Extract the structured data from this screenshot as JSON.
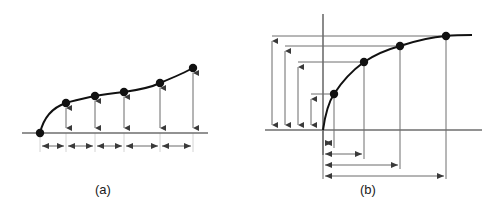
{
  "figure": {
    "background": "#ffffff",
    "stroke_curve": "#111111",
    "stroke_axis": "#6e6e6e",
    "stroke_dimension": "#5a5a5a",
    "dot_color": "#111111"
  },
  "panels": [
    {
      "id": "a",
      "caption": "(a)",
      "axis": {
        "x1": 22,
        "y1": 133,
        "x2": 208,
        "y2": 133
      },
      "curve_points": [
        {
          "x": 40,
          "y": 133
        },
        {
          "x": 66,
          "y": 103
        },
        {
          "x": 95,
          "y": 96
        },
        {
          "x": 124,
          "y": 92
        },
        {
          "x": 160,
          "y": 83
        },
        {
          "x": 193,
          "y": 68
        }
      ],
      "vertical_arrows": [
        {
          "x": 66,
          "top": 103,
          "bottom": 133
        },
        {
          "x": 95,
          "top": 96,
          "bottom": 133
        },
        {
          "x": 124,
          "top": 92,
          "bottom": 133
        },
        {
          "x": 160,
          "top": 83,
          "bottom": 133
        },
        {
          "x": 193,
          "top": 68,
          "bottom": 133
        }
      ],
      "interval_dimensions": [
        {
          "x1": 40,
          "x2": 66,
          "y": 146
        },
        {
          "x1": 66,
          "x2": 95,
          "y": 146
        },
        {
          "x1": 95,
          "x2": 124,
          "y": 146
        },
        {
          "x1": 124,
          "x2": 160,
          "y": 146
        },
        {
          "x1": 160,
          "x2": 193,
          "y": 146
        }
      ],
      "tick_guides": [
        {
          "x": 40,
          "y1": 133,
          "y2": 152
        },
        {
          "x": 66,
          "y1": 133,
          "y2": 152
        },
        {
          "x": 95,
          "y1": 133,
          "y2": 152
        },
        {
          "x": 124,
          "y1": 133,
          "y2": 152
        },
        {
          "x": 160,
          "y1": 133,
          "y2": 152
        },
        {
          "x": 193,
          "y1": 133,
          "y2": 152
        }
      ]
    },
    {
      "id": "b",
      "caption": "(b)",
      "x_axis": {
        "x1": 265,
        "y1": 130,
        "x2": 482,
        "y2": 130
      },
      "y_axis": {
        "x": 323,
        "y1": 14,
        "y2": 155
      },
      "origin": {
        "x": 323,
        "y": 130
      },
      "curve_points": [
        {
          "x": 334,
          "y": 94
        },
        {
          "x": 364,
          "y": 62
        },
        {
          "x": 400,
          "y": 46
        },
        {
          "x": 446,
          "y": 36
        }
      ],
      "horizontal_leaders": [
        {
          "x1": 311,
          "x2": 334,
          "y": 94
        },
        {
          "x1": 298,
          "x2": 364,
          "y": 62
        },
        {
          "x1": 285,
          "x2": 400,
          "y": 46
        },
        {
          "x1": 272,
          "x2": 446,
          "y": 36
        }
      ],
      "vertical_dimensions": [
        {
          "x": 272,
          "top": 36,
          "bottom": 130
        },
        {
          "x": 285,
          "top": 46,
          "bottom": 130
        },
        {
          "x": 298,
          "top": 62,
          "bottom": 130
        },
        {
          "x": 311,
          "top": 94,
          "bottom": 130
        }
      ],
      "drop_lines": [
        {
          "x": 334,
          "y1": 94,
          "y2": 148
        },
        {
          "x": 364,
          "y1": 62,
          "y2": 159
        },
        {
          "x": 400,
          "y1": 46,
          "y2": 169
        },
        {
          "x": 446,
          "y1": 36,
          "y2": 179
        }
      ],
      "horizontal_dimensions": [
        {
          "x1": 323,
          "x2": 334,
          "y": 143
        },
        {
          "x1": 323,
          "x2": 364,
          "y": 154
        },
        {
          "x1": 323,
          "x2": 400,
          "y": 165
        },
        {
          "x1": 323,
          "x2": 446,
          "y": 176
        }
      ],
      "origin_guide": {
        "x": 323,
        "y1": 130,
        "y2": 179
      }
    }
  ]
}
